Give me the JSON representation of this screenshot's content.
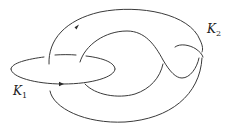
{
  "diagram": {
    "type": "link-diagram",
    "components": [
      {
        "id": "K1",
        "label": "K",
        "subscript": "1",
        "orientation_arrow": "right"
      },
      {
        "id": "K2",
        "label": "K",
        "subscript": "2",
        "orientation_arrow": "up-right"
      }
    ],
    "colors": {
      "stroke": "#3a3a3a",
      "background": "#ffffff",
      "text": "#222222"
    }
  }
}
